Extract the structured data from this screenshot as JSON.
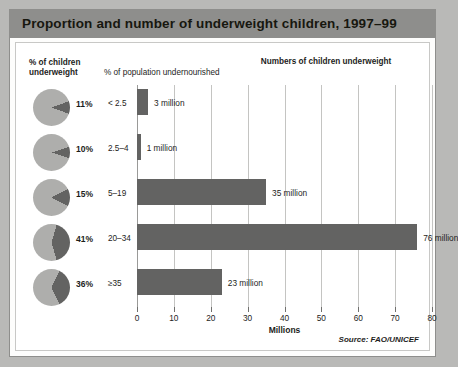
{
  "figure": {
    "title": "Proportion and number of underweight children, 1997–99",
    "source": "Source: FAO/UNICEF",
    "headers": {
      "left": "% of children underweight",
      "middle": "% of population undernourished",
      "right": "Numbers of children underweight"
    }
  },
  "chart_data": {
    "type": "bar",
    "orientation": "horizontal",
    "title": "Numbers of children underweight",
    "xlabel": "Millions",
    "ylabel": "% of population undernourished",
    "xlim": [
      0,
      80
    ],
    "xticks": [
      0,
      10,
      20,
      30,
      40,
      50,
      60,
      70,
      80
    ],
    "xtick_labels": [
      "0",
      "10",
      "20",
      "30",
      "40",
      "50",
      "60",
      "70",
      "80"
    ],
    "grid": true,
    "legend": false,
    "categories": [
      "< 2.5",
      "2.5–4",
      "5–19",
      "20–34",
      "≥35"
    ],
    "values": [
      3,
      1,
      35,
      76,
      23
    ],
    "value_labels": [
      "3 million",
      "1 million",
      "35 million",
      "76 million",
      "23 million"
    ],
    "secondary_series": {
      "name": "% of children underweight",
      "type": "pie",
      "values": [
        11,
        10,
        15,
        41,
        36
      ],
      "labels": [
        "11%",
        "10%",
        "15%",
        "41%",
        "36%"
      ]
    }
  },
  "colors": {
    "page_background": "#b9b9b7",
    "title_bar": "#8e8e8c",
    "bar_fill": "#636362",
    "pie_base": "#aeaeac",
    "pie_wedge": "#636362",
    "gridline": "#c4c4c2",
    "text": "#1d1d1b"
  }
}
